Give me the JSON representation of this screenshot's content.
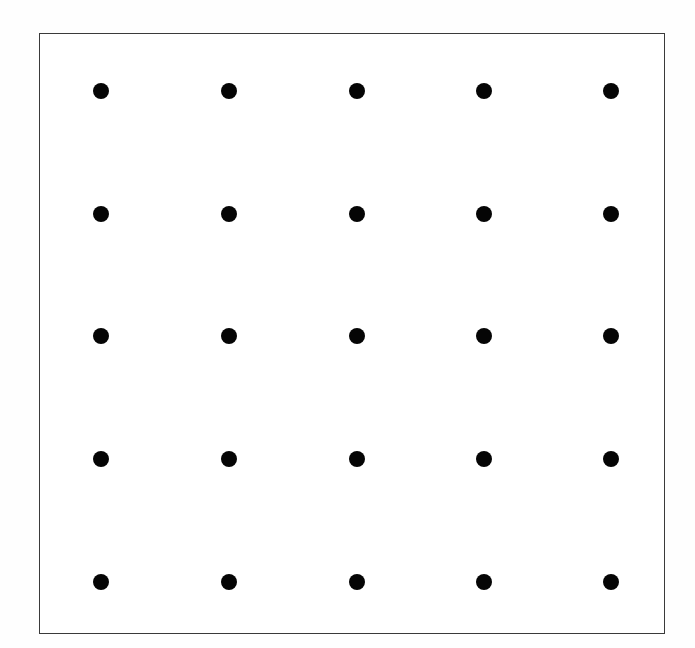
{
  "figure": {
    "title": "",
    "background_color": "#fefefe",
    "width": 695,
    "height": 648
  },
  "plot_frame": {
    "name": "square-border-box",
    "left": 39,
    "top": 33,
    "right": 665,
    "bottom": 634,
    "width": 626,
    "height": 601,
    "border_color": "#3a3a3a",
    "border_width": 1,
    "fill_color": "#ffffff"
  },
  "chart_data": {
    "type": "scatter",
    "title": "",
    "subtitle": "",
    "xlabel": "",
    "ylabel": "",
    "legend": [],
    "legend_position": "none",
    "grid": false,
    "axis_ticks": [],
    "xlim": [
      0,
      695
    ],
    "ylim": [
      648,
      0
    ],
    "marker": {
      "shape": "circle",
      "color": "#050505",
      "diameter_px": 16,
      "count": 25
    },
    "layout": {
      "rows": 5,
      "columns": 5,
      "column_centers_px": [
        101,
        229,
        357,
        484,
        611
      ],
      "row_centers_px": [
        91,
        214,
        336,
        459,
        582
      ],
      "column_spacing_px": 127.5,
      "row_spacing_px": 122.75
    },
    "points": [
      {
        "x": 101,
        "y": 91
      },
      {
        "x": 229,
        "y": 91
      },
      {
        "x": 357,
        "y": 91
      },
      {
        "x": 484,
        "y": 91
      },
      {
        "x": 611,
        "y": 91
      },
      {
        "x": 101,
        "y": 214
      },
      {
        "x": 229,
        "y": 214
      },
      {
        "x": 357,
        "y": 214
      },
      {
        "x": 484,
        "y": 214
      },
      {
        "x": 611,
        "y": 214
      },
      {
        "x": 101,
        "y": 336
      },
      {
        "x": 229,
        "y": 336
      },
      {
        "x": 357,
        "y": 336
      },
      {
        "x": 484,
        "y": 336
      },
      {
        "x": 611,
        "y": 336
      },
      {
        "x": 101,
        "y": 459
      },
      {
        "x": 229,
        "y": 459
      },
      {
        "x": 357,
        "y": 459
      },
      {
        "x": 484,
        "y": 459
      },
      {
        "x": 611,
        "y": 459
      },
      {
        "x": 101,
        "y": 582
      },
      {
        "x": 229,
        "y": 582
      },
      {
        "x": 357,
        "y": 582
      },
      {
        "x": 484,
        "y": 582
      },
      {
        "x": 611,
        "y": 582
      }
    ]
  }
}
